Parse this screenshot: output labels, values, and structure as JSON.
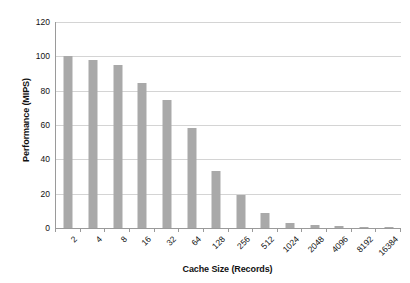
{
  "chart_data": {
    "type": "bar",
    "title": "",
    "xlabel": "Cache Size (Records)",
    "ylabel": "Performance (MIPS)",
    "categories": [
      "2",
      "4",
      "8",
      "16",
      "32",
      "64",
      "128",
      "256",
      "512",
      "1024",
      "2048",
      "4096",
      "8192",
      "16384"
    ],
    "values": [
      100,
      98,
      95,
      84.5,
      74.5,
      58.3,
      33.2,
      19.2,
      8.7,
      3.0,
      2.0,
      1.0,
      0.5,
      0.2
    ],
    "ylim": [
      0,
      120
    ],
    "yticks": [
      0,
      20,
      40,
      60,
      80,
      100,
      120
    ],
    "ytick_labels": [
      "0",
      "20",
      "40",
      "60",
      "80",
      "100",
      "120"
    ],
    "xlim_categorical": true,
    "grid": "horizontal",
    "legend": "none",
    "series": [
      {
        "name": "Performance",
        "color": "#a9a9a9",
        "values": [
          100,
          98,
          95,
          84.5,
          74.5,
          58.3,
          33.2,
          19.2,
          8.7,
          3.0,
          2.0,
          1.0,
          0.5,
          0.2
        ]
      }
    ]
  },
  "axes": {
    "y_title": "Performance (MIPS)",
    "x_title": "Cache Size (Records)"
  },
  "colors": {
    "bar": "#a9a9a9",
    "grid": "#d4d4d4",
    "axis": "#9a9a9a",
    "text": "#111111",
    "background": "#ffffff"
  }
}
